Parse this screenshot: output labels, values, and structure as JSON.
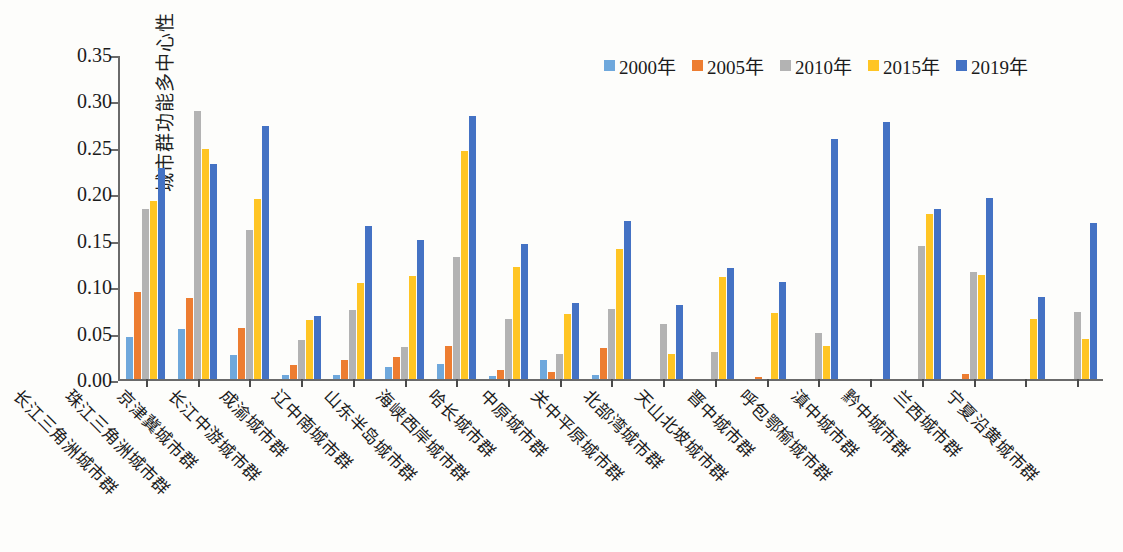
{
  "chart_data": {
    "type": "bar",
    "title": "",
    "xlabel": "",
    "ylabel": "城市群功能多中心性",
    "ylim": [
      0,
      0.35
    ],
    "yticks": [
      "0.00",
      "0.05",
      "0.10",
      "0.15",
      "0.20",
      "0.25",
      "0.30",
      "0.35"
    ],
    "ytick_values": [
      0.0,
      0.05,
      0.1,
      0.15,
      0.2,
      0.25,
      0.3,
      0.35
    ],
    "grid": false,
    "legend_position": "top-right",
    "categories": [
      "长江三角洲城市群",
      "珠江三角洲城市群",
      "京津冀城市群",
      "长江中游城市群",
      "成渝城市群",
      "辽中南城市群",
      "山东半岛城市群",
      "海峡西岸城市群",
      "哈长城市群",
      "中原城市群",
      "关中平原城市群",
      "北部湾城市群",
      "天山北坡城市群",
      "晋中城市群",
      "呼包鄂榆城市群",
      "滇中城市群",
      "黔中城市群",
      "兰西城市群",
      "宁夏沿黄城市群"
    ],
    "series": [
      {
        "name": "2000年",
        "color": "#6fa8dc",
        "values": [
          0.045,
          0.054,
          0.026,
          0.004,
          0.004,
          0.013,
          0.016,
          0.003,
          0.021,
          0.004,
          0.0,
          0.0,
          0.0,
          0.0,
          0.0,
          0.0,
          0.0,
          0.0,
          0.0
        ]
      },
      {
        "name": "2005年",
        "color": "#ed7d31",
        "values": [
          0.094,
          0.087,
          0.055,
          0.015,
          0.021,
          0.024,
          0.036,
          0.01,
          0.008,
          0.033,
          0.0,
          0.0,
          0.002,
          0.0,
          0.0,
          0.0,
          0.005,
          0.0,
          0.0
        ]
      },
      {
        "name": "2010年",
        "color": "#b3b3b3",
        "values": [
          0.183,
          0.289,
          0.16,
          0.042,
          0.074,
          0.034,
          0.131,
          0.065,
          0.027,
          0.075,
          0.059,
          0.029,
          0.0,
          0.05,
          0.0,
          0.143,
          0.115,
          0.0,
          0.072
        ]
      },
      {
        "name": "2015年",
        "color": "#ffc524",
        "values": [
          0.192,
          0.248,
          0.194,
          0.064,
          0.103,
          0.111,
          0.246,
          0.121,
          0.07,
          0.14,
          0.027,
          0.11,
          0.071,
          0.036,
          0.0,
          0.178,
          0.112,
          0.065,
          0.043
        ]
      },
      {
        "name": "2019年",
        "color": "#4472c4",
        "values": [
          0.227,
          0.232,
          0.272,
          0.068,
          0.165,
          0.15,
          0.283,
          0.145,
          0.082,
          0.17,
          0.08,
          0.12,
          0.104,
          0.258,
          0.277,
          0.183,
          0.195,
          0.088,
          0.168
        ]
      }
    ]
  }
}
